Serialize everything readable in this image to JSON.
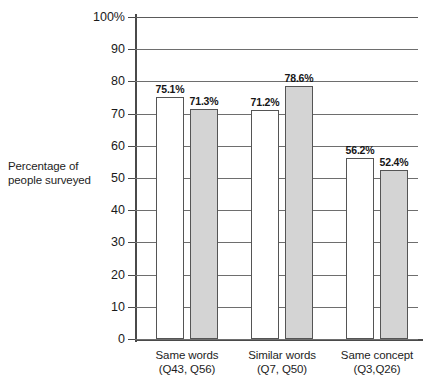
{
  "chart_data": {
    "type": "bar",
    "title": "",
    "xlabel": "",
    "ylabel": "Percentage of people surveyed",
    "ylabel_line1": "Percentage of",
    "ylabel_line2": "people surveyed",
    "ylim": [
      0,
      100
    ],
    "grid": true,
    "legend": "none",
    "categories": [
      "Same words (Q43, Q56)",
      "Similar words (Q7, Q50)",
      "Same concept (Q3,Q26)"
    ],
    "category_lines": [
      {
        "line1": "Same words",
        "line2": "(Q43, Q56)"
      },
      {
        "line1": "Similar words",
        "line2": "(Q7, Q50)"
      },
      {
        "line1": "Same concept",
        "line2": "(Q3,Q26)"
      }
    ],
    "series": [
      {
        "name": "first",
        "fill": "#ffffff",
        "values": [
          75.1,
          71.2,
          56.2
        ],
        "labels": [
          "75.1%",
          "71.2%",
          "56.2%"
        ]
      },
      {
        "name": "second",
        "fill": "#d4d4d4",
        "values": [
          71.3,
          78.6,
          52.4
        ],
        "labels": [
          "71.3%",
          "78.6%",
          "52.4%"
        ]
      }
    ],
    "bars": [
      {
        "group": 0,
        "series": 0,
        "value": 75.1,
        "label": "75.1%",
        "fill": "white"
      },
      {
        "group": 0,
        "series": 1,
        "value": 71.3,
        "label": "71.3%",
        "fill": "gray"
      },
      {
        "group": 1,
        "series": 0,
        "value": 71.2,
        "label": "71.2%",
        "fill": "white"
      },
      {
        "group": 1,
        "series": 1,
        "value": 78.6,
        "label": "78.6%",
        "fill": "gray"
      },
      {
        "group": 2,
        "series": 0,
        "value": 56.2,
        "label": "56.2%",
        "fill": "white"
      },
      {
        "group": 2,
        "series": 1,
        "value": 52.4,
        "label": "52.4%",
        "fill": "gray"
      }
    ],
    "yticks": [
      0,
      10,
      20,
      30,
      40,
      50,
      60,
      70,
      80,
      90,
      100
    ],
    "ytick_labels": [
      "0",
      "10",
      "20",
      "30",
      "40",
      "50",
      "60",
      "70",
      "80",
      "90",
      "100%"
    ],
    "colors": {
      "bar_white": "#ffffff",
      "bar_gray": "#d4d4d4",
      "bar_outline": "#555555",
      "gridline": "#6e6e6e",
      "axis": "#4a4a4a",
      "text": "#1a1a1a",
      "background": "#ffffff"
    }
  }
}
